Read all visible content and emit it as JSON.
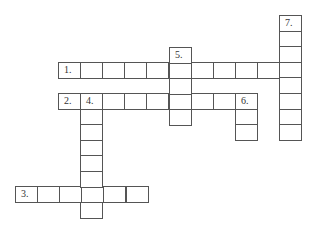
{
  "puzzle": {
    "type": "crossword",
    "cell_width": 22.1,
    "cell_height": 15.6,
    "border_color": "#555555",
    "background": "#ffffff",
    "entries": [
      {
        "number": "1.",
        "label": "1.",
        "direction": "across",
        "x": 58,
        "y": 62,
        "length": 11
      },
      {
        "number": "2.",
        "label": "2.",
        "direction": "across",
        "x": 58,
        "y": 93,
        "length": 9
      },
      {
        "number": "3.",
        "label": "3.",
        "direction": "across",
        "x": 15,
        "y": 186,
        "length": 6
      },
      {
        "number": "4.",
        "label": "4.",
        "direction": "down",
        "x": 80,
        "y": 93,
        "length": 8
      },
      {
        "number": "5.",
        "label": "5.",
        "direction": "down",
        "x": 169,
        "y": 47,
        "length": 5
      },
      {
        "number": "6.",
        "label": "6.",
        "direction": "down",
        "x": 235,
        "y": 93,
        "length": 3
      },
      {
        "number": "7.",
        "label": "7.",
        "direction": "down",
        "x": 279,
        "y": 15,
        "length": 8
      }
    ]
  }
}
